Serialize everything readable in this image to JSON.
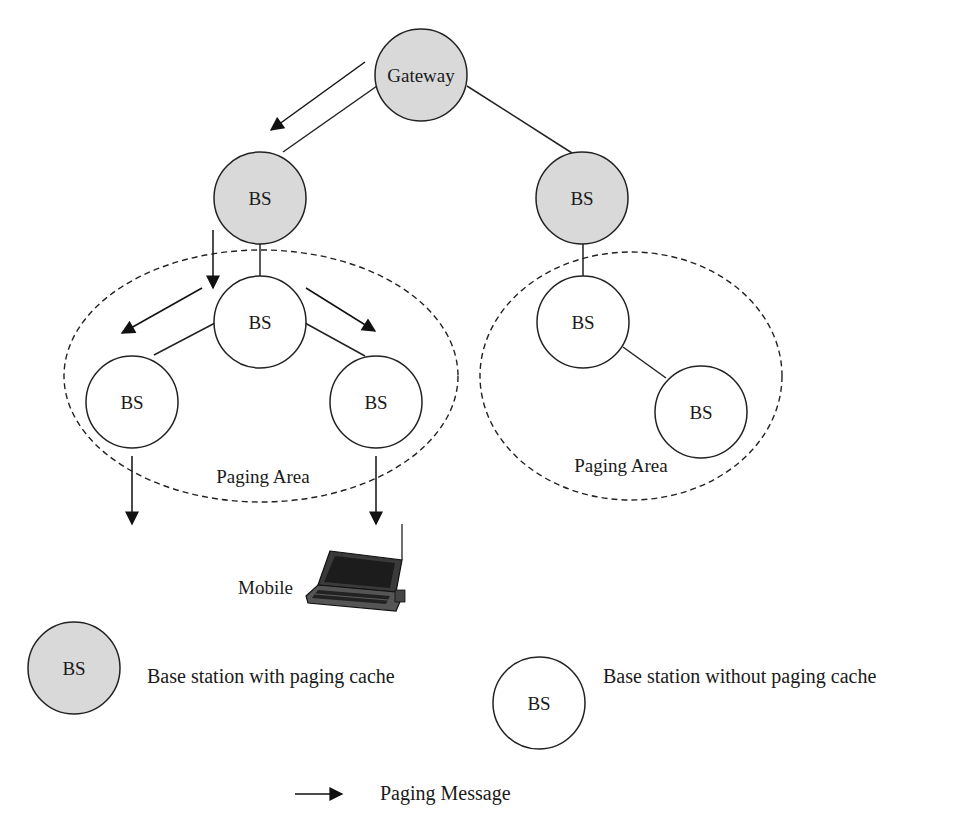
{
  "diagram": {
    "colors": {
      "cache_fill": "#d9d9d9",
      "nocache_fill": "#ffffff",
      "stroke": "#222222",
      "arrow": "#111111"
    },
    "nodes": {
      "gateway": {
        "label": "Gateway",
        "type": "cache"
      },
      "bs_left_cache": {
        "label": "BS",
        "type": "cache"
      },
      "bs_right_cache": {
        "label": "BS",
        "type": "cache"
      },
      "bs_left_mid": {
        "label": "BS",
        "type": "nocache"
      },
      "bs_left_low_left": {
        "label": "BS",
        "type": "nocache"
      },
      "bs_left_low_right": {
        "label": "BS",
        "type": "nocache"
      },
      "bs_right_mid": {
        "label": "BS",
        "type": "nocache"
      },
      "bs_right_low": {
        "label": "BS",
        "type": "nocache"
      }
    },
    "paging_areas": [
      {
        "label": "Paging Area"
      },
      {
        "label": "Paging Area"
      }
    ],
    "mobile": {
      "label": "Mobile",
      "icon": "laptop-icon"
    }
  },
  "legend": {
    "cache": {
      "node_label": "BS",
      "description": "Base station with paging cache"
    },
    "nocache": {
      "node_label": "BS",
      "description": "Base station without paging cache"
    },
    "arrow": {
      "description": "Paging Message",
      "icon": "arrow-right-icon"
    }
  }
}
